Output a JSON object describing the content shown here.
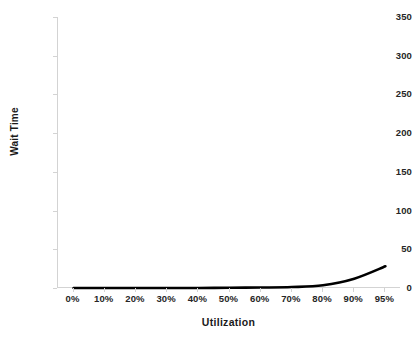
{
  "chart_data": {
    "type": "line",
    "title": "",
    "subtitle": "",
    "xlabel": "Utilization",
    "ylabel": "Wait Time",
    "categories": [
      "0%",
      "10%",
      "20%",
      "30%",
      "40%",
      "50%",
      "60%",
      "70%",
      "80%",
      "90%",
      "95%"
    ],
    "values": [
      0,
      0,
      0,
      0,
      0,
      0.3,
      0.6,
      1.2,
      3.5,
      12,
      28
    ],
    "series": [
      {
        "name": "Wait Time",
        "values": [
          0,
          0,
          0,
          0,
          0,
          0.3,
          0.6,
          1.2,
          3.5,
          12,
          28
        ],
        "color": "#000000"
      }
    ],
    "ylim": [
      0,
      350
    ],
    "y_ticks": [
      0,
      50,
      100,
      150,
      200,
      250,
      300,
      350
    ],
    "y_tick_labels": [
      "0",
      "50",
      "100",
      "150",
      "200",
      "250",
      "300",
      "350"
    ],
    "x_tick_labels": [
      "0%",
      "10%",
      "20%",
      "30%",
      "40%",
      "50%",
      "60%",
      "70%",
      "80%",
      "90%",
      "95%"
    ],
    "grid": false,
    "legend": false,
    "legend_position": "none",
    "annotations": [],
    "colors": {
      "series_line": "#000000",
      "axis_line": "#d3d3d3",
      "tick_label": "#262626",
      "axis_title": "#1a1a1a",
      "background": "#ffffff"
    }
  }
}
